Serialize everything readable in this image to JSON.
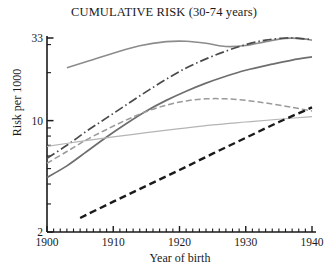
{
  "chart_data": {
    "type": "line",
    "title": "CUMULATIVE RISK (30-74 years)",
    "xlabel": "Year of birth",
    "ylabel": "Risk per 1000",
    "xlim": [
      1900,
      1940
    ],
    "ylim": [
      2,
      33
    ],
    "yscale": "log",
    "grid": false,
    "legend": "none",
    "xticks": [
      1900,
      1910,
      1920,
      1930,
      1940
    ],
    "xticklabels": [
      "1900",
      "1910",
      "1920",
      "1930",
      "1940"
    ],
    "xminortick_step": 1,
    "yticks": [
      2,
      10,
      33
    ],
    "yticklabels": [
      "2",
      "10",
      "33"
    ],
    "yminorticks": [
      3,
      4,
      5,
      6,
      7,
      8,
      9,
      20,
      30
    ],
    "series": [
      {
        "name": "series-1-upper-grey-solid",
        "style": "solid",
        "color": "#8c8c8c",
        "width": 1.6,
        "x": [
          1903,
          1906,
          1910,
          1914,
          1918,
          1921,
          1924,
          1927,
          1930,
          1933,
          1936,
          1938,
          1940
        ],
        "y": [
          21.5,
          23.5,
          26.5,
          29.5,
          31.3,
          31.5,
          30.6,
          29.2,
          29.6,
          31.3,
          32.8,
          32.8,
          32.0
        ]
      },
      {
        "name": "series-2-dash-dot-dark",
        "style": "dashdot",
        "color": "#4a4a4a",
        "width": 1.7,
        "x": [
          1900,
          1903,
          1906,
          1909,
          1912,
          1915,
          1918,
          1921,
          1924,
          1927,
          1930,
          1933,
          1936,
          1938,
          1940
        ],
        "y": [
          5.8,
          7.0,
          8.6,
          10.4,
          12.6,
          15.2,
          18.2,
          21.4,
          24.4,
          27.3,
          30.0,
          32.0,
          33.0,
          32.8,
          32.3
        ]
      },
      {
        "name": "series-3-medium-grey-solid",
        "style": "solid",
        "color": "#6e6e6e",
        "width": 1.7,
        "x": [
          1900,
          1903,
          1906,
          1909,
          1912,
          1915,
          1918,
          1921,
          1924,
          1927,
          1930,
          1934,
          1937,
          1940
        ],
        "y": [
          4.4,
          5.2,
          6.4,
          7.9,
          9.6,
          11.5,
          13.4,
          15.3,
          17.2,
          19.0,
          20.7,
          22.6,
          24.0,
          25.1
        ]
      },
      {
        "name": "series-4-grey-dashed",
        "style": "dashed",
        "color": "#9a9a9a",
        "width": 1.5,
        "x": [
          1900,
          1903,
          1906,
          1909,
          1912,
          1915,
          1918,
          1921,
          1924,
          1927,
          1930,
          1933,
          1936,
          1938,
          1940
        ],
        "y": [
          5.4,
          6.4,
          7.6,
          8.8,
          10.1,
          11.4,
          12.5,
          13.3,
          13.7,
          13.7,
          13.4,
          12.9,
          12.3,
          11.9,
          11.5
        ]
      },
      {
        "name": "series-5-light-grey-thin",
        "style": "solid",
        "color": "#b4b4b4",
        "width": 1.2,
        "x": [
          1900,
          1905,
          1910,
          1915,
          1920,
          1925,
          1930,
          1935,
          1940
        ],
        "y": [
          6.9,
          7.4,
          7.9,
          8.4,
          8.9,
          9.4,
          9.8,
          10.2,
          10.6
        ]
      },
      {
        "name": "series-6-black-bold-dashed",
        "style": "dashed-bold",
        "color": "#1a1a1a",
        "width": 2.4,
        "x": [
          1905,
          1910,
          1915,
          1920,
          1925,
          1930,
          1935,
          1940
        ],
        "y": [
          2.45,
          3.1,
          3.9,
          4.9,
          6.2,
          7.8,
          9.8,
          12.1
        ]
      }
    ]
  }
}
